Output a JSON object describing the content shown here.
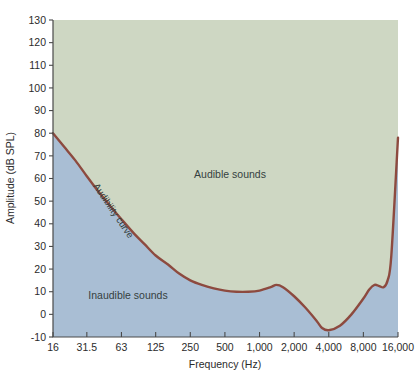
{
  "figure": {
    "name": "audibility-curve-chart",
    "background": "#ffffff"
  },
  "colors": {
    "audible_region": "#ced7c3",
    "inaudible_region": "#a9bed4",
    "curve": "#8d4a3f",
    "axis": "#4a4a4a",
    "text": "#2b2b2b"
  },
  "chart_data": {
    "type": "line",
    "title": "",
    "xlabel": "Frequency (Hz)",
    "ylabel": "Amplitude (dB SPL)",
    "xscale": "log",
    "xlim": [
      16,
      16000
    ],
    "ylim": [
      -10,
      130
    ],
    "grid": false,
    "legend": "none",
    "xtick_labels": [
      "16",
      "31.5",
      "63",
      "125",
      "250",
      "500",
      "1,000",
      "2,000",
      "4,000",
      "8,000",
      "16,000"
    ],
    "xtick_values": [
      16,
      31.5,
      63,
      125,
      250,
      500,
      1000,
      2000,
      4000,
      8000,
      16000
    ],
    "ytick_labels": [
      "130",
      "120",
      "110",
      "100",
      "90",
      "80",
      "70",
      "60",
      "50",
      "40",
      "30",
      "20",
      "10",
      "0",
      "-10"
    ],
    "ytick_values": [
      130,
      120,
      110,
      100,
      90,
      80,
      70,
      60,
      50,
      40,
      30,
      20,
      10,
      0,
      -10
    ],
    "series": [
      {
        "name": "Audibility curve",
        "color": "#8d4a3f",
        "x": [
          16,
          20,
          25,
          31.5,
          40,
          50,
          63,
          80,
          100,
          125,
          160,
          200,
          250,
          315,
          400,
          500,
          630,
          800,
          1000,
          1250,
          1400,
          1600,
          2000,
          2500,
          3150,
          3500,
          4000,
          5000,
          6300,
          8000,
          9000,
          10000,
          11000,
          12000,
          13000,
          14000,
          16000
        ],
        "y": [
          80,
          74,
          68,
          61,
          54,
          48,
          42,
          36,
          31,
          26,
          22,
          18,
          15,
          13,
          11.5,
          10.5,
          10,
          10,
          10.5,
          12,
          13,
          12,
          8,
          3,
          -3,
          -6,
          -7,
          -5,
          0,
          7,
          11,
          13,
          12.5,
          12,
          15,
          26,
          78
        ]
      }
    ],
    "annotations": [
      {
        "text": "Audible sounds",
        "x_px": 230,
        "y_px": 178,
        "rotation": 0
      },
      {
        "text": "Inaudible sounds",
        "x_px": 128,
        "y_px": 299,
        "rotation": 0
      },
      {
        "text": "Audibility curve",
        "x_px": 93,
        "y_px": 186,
        "rotation": 56
      }
    ]
  }
}
